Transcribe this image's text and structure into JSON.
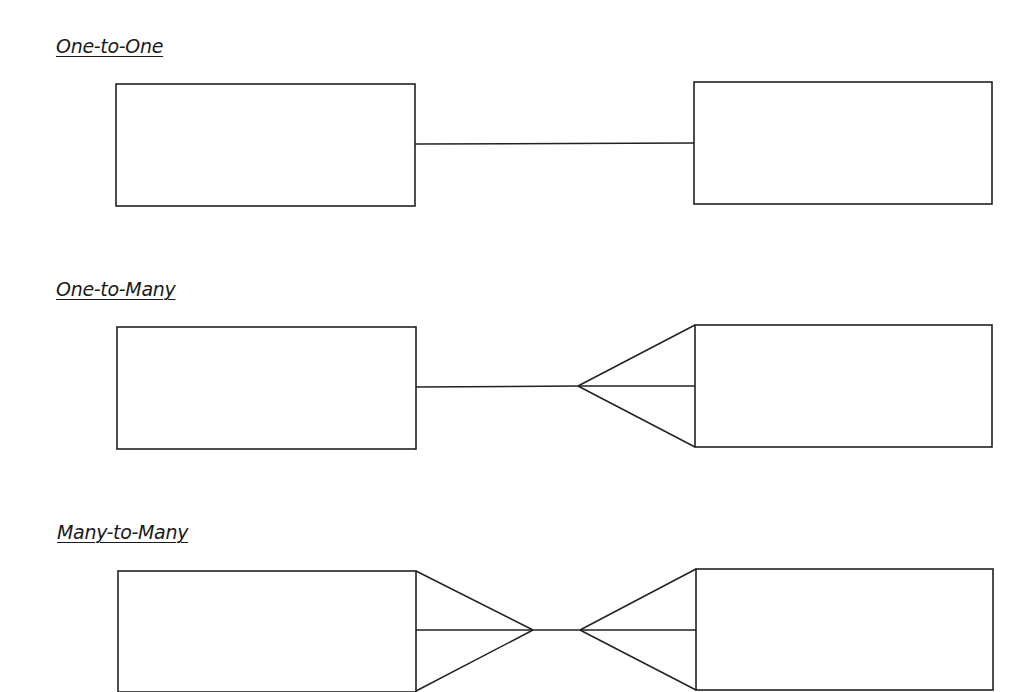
{
  "sections": [
    {
      "title": "One-to-One",
      "left_entity": {
        "x": 116,
        "y": 84,
        "w": 299,
        "h": 122
      },
      "right_entity": {
        "x": 694,
        "y": 82,
        "w": 298,
        "h": 122
      },
      "relationship": {
        "type": "one-to-one",
        "left_end": "one",
        "right_end": "one"
      }
    },
    {
      "title": "One-to-Many",
      "left_entity": {
        "x": 117,
        "y": 327,
        "w": 299,
        "h": 122
      },
      "right_entity": {
        "x": 695,
        "y": 325,
        "w": 297,
        "h": 122
      },
      "relationship": {
        "type": "one-to-many",
        "left_end": "one",
        "right_end": "many (crow's foot)"
      }
    },
    {
      "title": "Many-to-Many",
      "left_entity": {
        "x": 118,
        "y": 571,
        "w": 298,
        "h": 120
      },
      "right_entity": {
        "x": 696,
        "y": 569,
        "w": 297,
        "h": 121
      },
      "relationship": {
        "type": "many-to-many",
        "left_end": "many (crow's foot)",
        "right_end": "many (crow's foot)"
      }
    }
  ],
  "colors": {
    "stroke": "#222222",
    "text": "#1a1a1a",
    "background": "#ffffff"
  }
}
